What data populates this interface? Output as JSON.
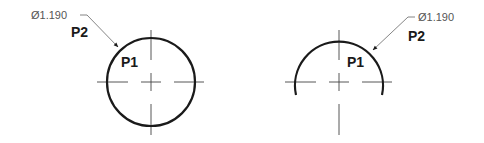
{
  "drawing": {
    "left_view": {
      "type": "full-circle",
      "dimension_label": "Ø1.190",
      "point_labels": {
        "p1": "P1",
        "p2": "P2"
      }
    },
    "right_view": {
      "type": "semicircle-arc",
      "dimension_label": "Ø1.190",
      "point_labels": {
        "p1": "P1",
        "p2": "P2"
      }
    }
  },
  "colors": {
    "outline": "#1a1a1a",
    "centerline": "#444444",
    "leader": "#666666",
    "dimension_text": "#555555"
  }
}
